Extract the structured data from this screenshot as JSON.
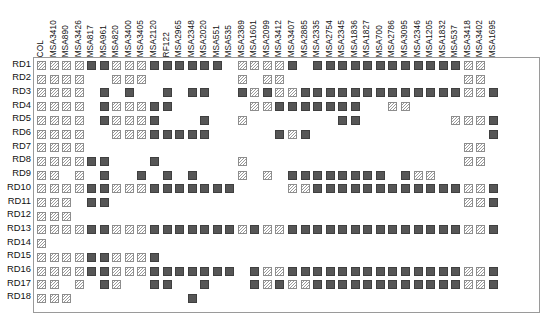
{
  "figure": {
    "type": "presence-absence-matrix",
    "rows_axis_name": "RD profile",
    "columns_axis_name": "isolate",
    "marker_legend": {
      "hatched": "hatched-square-marker",
      "solid": "solid-square-marker"
    },
    "colors": {
      "solid_fill": "#565656",
      "solid_border": "#3f3f3f",
      "hatch_border": "#8d8d8d",
      "hatch_line": "#9b9b9b",
      "frame": "#9a9a9a",
      "background": "#ffffff",
      "text": "#111111"
    }
  },
  "columns": [
    "COL",
    "MSA3410",
    "MSA890",
    "MSA3426",
    "MSA817",
    "MSA961",
    "MSA820",
    "MSA3400",
    "MSA3405",
    "MSA2120",
    "RF122",
    "MSA2965",
    "MSA2348",
    "MSA2020",
    "MSA551",
    "MSA535",
    "MSA2389",
    "MSA1601",
    "MSA2099",
    "MSA3412",
    "MSA3407",
    "MSA2885",
    "MSA2335",
    "MSA2754",
    "MSA2345",
    "MSA1836",
    "MSA1827",
    "MSA700",
    "MSA2786",
    "MSA3095",
    "MSA2346",
    "MSA1205",
    "MSA1832",
    "MSA537",
    "MSA3418",
    "MSA3402",
    "MSA1695"
  ],
  "rows": [
    "RD1",
    "RD2",
    "RD3",
    "RD4",
    "RD5",
    "RD6",
    "RD7",
    "RD8",
    "RD9",
    "RD10",
    "RD11",
    "RD12",
    "RD13",
    "RD14",
    "RD15",
    "RD16",
    "RD17",
    "RD18"
  ],
  "chart_data": {
    "type": "heatmap",
    "title": "",
    "xlabel": "",
    "ylabel": "",
    "legend_position": "none",
    "grid": false,
    "value_codes": {
      "0": "empty",
      "1": "hatched",
      "2": "solid"
    },
    "categories": [
      "COL",
      "MSA3410",
      "MSA890",
      "MSA3426",
      "MSA817",
      "MSA961",
      "MSA820",
      "MSA3400",
      "MSA3405",
      "MSA2120",
      "RF122",
      "MSA2965",
      "MSA2348",
      "MSA2020",
      "MSA551",
      "MSA535",
      "MSA2389",
      "MSA1601",
      "MSA2099",
      "MSA3412",
      "MSA3407",
      "MSA2885",
      "MSA2335",
      "MSA2754",
      "MSA2345",
      "MSA1836",
      "MSA1827",
      "MSA700",
      "MSA2786",
      "MSA3095",
      "MSA2346",
      "MSA1205",
      "MSA1832",
      "MSA537",
      "MSA3418",
      "MSA3402",
      "MSA1695"
    ],
    "series": [
      {
        "name": "RD1",
        "values": [
          1,
          1,
          1,
          1,
          2,
          2,
          1,
          1,
          1,
          2,
          2,
          2,
          2,
          2,
          2,
          0,
          1,
          1,
          1,
          1,
          2,
          0,
          2,
          2,
          2,
          2,
          2,
          2,
          2,
          2,
          2,
          2,
          2,
          2,
          1,
          1,
          0
        ]
      },
      {
        "name": "RD2",
        "values": [
          1,
          1,
          1,
          1,
          0,
          0,
          1,
          1,
          1,
          0,
          0,
          0,
          0,
          0,
          0,
          0,
          1,
          0,
          1,
          1,
          0,
          0,
          0,
          0,
          0,
          0,
          0,
          0,
          0,
          0,
          0,
          0,
          0,
          0,
          1,
          1,
          0
        ]
      },
      {
        "name": "RD3",
        "values": [
          1,
          1,
          1,
          1,
          0,
          2,
          0,
          2,
          0,
          0,
          2,
          0,
          2,
          2,
          0,
          0,
          2,
          1,
          2,
          1,
          1,
          2,
          2,
          2,
          2,
          2,
          2,
          2,
          2,
          2,
          2,
          2,
          2,
          2,
          1,
          1,
          2
        ]
      },
      {
        "name": "RD4",
        "values": [
          1,
          1,
          1,
          1,
          0,
          2,
          1,
          1,
          1,
          2,
          2,
          0,
          0,
          0,
          0,
          0,
          0,
          1,
          1,
          2,
          2,
          2,
          2,
          2,
          2,
          2,
          0,
          0,
          1,
          1,
          0,
          0,
          0,
          0,
          0,
          0,
          0
        ]
      },
      {
        "name": "RD5",
        "values": [
          1,
          1,
          1,
          1,
          0,
          2,
          1,
          1,
          1,
          2,
          0,
          0,
          0,
          2,
          0,
          0,
          1,
          0,
          0,
          0,
          0,
          0,
          0,
          0,
          2,
          2,
          0,
          0,
          0,
          0,
          0,
          0,
          0,
          1,
          1,
          1,
          2
        ]
      },
      {
        "name": "RD6",
        "values": [
          1,
          1,
          1,
          1,
          0,
          0,
          1,
          1,
          1,
          2,
          2,
          2,
          2,
          2,
          0,
          0,
          0,
          0,
          0,
          2,
          1,
          2,
          0,
          0,
          0,
          0,
          0,
          0,
          0,
          0,
          0,
          0,
          0,
          0,
          0,
          0,
          2
        ]
      },
      {
        "name": "RD7",
        "values": [
          1,
          1,
          1,
          1,
          0,
          0,
          0,
          0,
          0,
          0,
          0,
          0,
          0,
          0,
          0,
          0,
          0,
          0,
          0,
          0,
          0,
          0,
          0,
          0,
          0,
          0,
          0,
          0,
          0,
          0,
          0,
          0,
          0,
          0,
          1,
          1,
          0
        ]
      },
      {
        "name": "RD8",
        "values": [
          1,
          1,
          1,
          1,
          2,
          2,
          0,
          0,
          0,
          2,
          0,
          0,
          0,
          0,
          0,
          0,
          1,
          0,
          0,
          0,
          0,
          0,
          0,
          0,
          0,
          0,
          0,
          0,
          0,
          0,
          0,
          0,
          0,
          0,
          1,
          1,
          0
        ]
      },
      {
        "name": "RD9",
        "values": [
          1,
          1,
          0,
          1,
          0,
          2,
          0,
          0,
          2,
          0,
          2,
          0,
          2,
          0,
          0,
          0,
          1,
          0,
          1,
          0,
          2,
          2,
          2,
          2,
          2,
          2,
          2,
          2,
          0,
          2,
          1,
          1,
          0,
          0,
          0,
          0,
          0
        ]
      },
      {
        "name": "RD10",
        "values": [
          1,
          1,
          1,
          1,
          2,
          2,
          1,
          1,
          1,
          2,
          2,
          2,
          2,
          2,
          2,
          2,
          0,
          0,
          0,
          0,
          1,
          1,
          2,
          2,
          2,
          2,
          2,
          2,
          2,
          2,
          2,
          2,
          2,
          2,
          1,
          1,
          2
        ]
      },
      {
        "name": "RD11",
        "values": [
          1,
          1,
          1,
          0,
          2,
          2,
          0,
          0,
          0,
          0,
          0,
          0,
          0,
          0,
          0,
          0,
          0,
          0,
          0,
          0,
          0,
          0,
          0,
          0,
          0,
          0,
          0,
          0,
          0,
          0,
          0,
          0,
          0,
          0,
          1,
          1,
          2
        ]
      },
      {
        "name": "RD12",
        "values": [
          1,
          1,
          1,
          0,
          0,
          0,
          0,
          0,
          0,
          0,
          0,
          0,
          0,
          0,
          0,
          0,
          0,
          0,
          0,
          0,
          0,
          0,
          0,
          0,
          0,
          0,
          0,
          0,
          0,
          0,
          0,
          0,
          0,
          0,
          0,
          0,
          0
        ]
      },
      {
        "name": "RD13",
        "values": [
          1,
          1,
          1,
          1,
          2,
          2,
          1,
          1,
          1,
          2,
          2,
          2,
          2,
          2,
          2,
          2,
          1,
          2,
          1,
          1,
          2,
          2,
          2,
          2,
          2,
          2,
          2,
          2,
          2,
          2,
          2,
          2,
          2,
          2,
          1,
          1,
          2
        ]
      },
      {
        "name": "RD14",
        "values": [
          1,
          0,
          0,
          0,
          0,
          0,
          0,
          0,
          0,
          0,
          0,
          0,
          0,
          0,
          0,
          0,
          0,
          0,
          0,
          0,
          0,
          0,
          0,
          0,
          0,
          0,
          0,
          0,
          0,
          0,
          0,
          0,
          0,
          0,
          0,
          0,
          0
        ]
      },
      {
        "name": "RD15",
        "values": [
          1,
          1,
          1,
          1,
          2,
          2,
          1,
          1,
          1,
          2,
          0,
          0,
          0,
          0,
          0,
          0,
          0,
          0,
          0,
          0,
          0,
          0,
          0,
          0,
          0,
          0,
          0,
          0,
          0,
          0,
          0,
          0,
          0,
          0,
          0,
          0,
          0
        ]
      },
      {
        "name": "RD16",
        "values": [
          1,
          1,
          1,
          1,
          2,
          2,
          1,
          1,
          1,
          2,
          2,
          2,
          2,
          2,
          2,
          2,
          0,
          2,
          1,
          1,
          2,
          2,
          2,
          2,
          2,
          2,
          2,
          2,
          2,
          2,
          2,
          2,
          2,
          2,
          1,
          1,
          2
        ]
      },
      {
        "name": "RD17",
        "values": [
          1,
          1,
          0,
          1,
          0,
          2,
          1,
          0,
          0,
          2,
          2,
          0,
          0,
          2,
          0,
          0,
          0,
          2,
          1,
          2,
          1,
          1,
          2,
          2,
          2,
          2,
          2,
          2,
          2,
          2,
          2,
          2,
          2,
          2,
          1,
          1,
          2
        ]
      },
      {
        "name": "RD18",
        "values": [
          1,
          1,
          1,
          0,
          0,
          0,
          0,
          0,
          0,
          0,
          0,
          0,
          2,
          0,
          0,
          0,
          0,
          0,
          0,
          0,
          0,
          0,
          0,
          0,
          0,
          0,
          0,
          0,
          0,
          0,
          0,
          0,
          0,
          0,
          0,
          0,
          0
        ]
      }
    ]
  },
  "layout": {
    "plot_left": 33,
    "plot_top": 57,
    "col_pitch": 12.55,
    "col_offset": 4.0,
    "row_pitch": 13.7,
    "row_offset": 4.0
  }
}
